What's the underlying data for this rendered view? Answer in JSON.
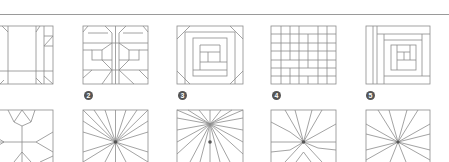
{
  "figure": {
    "line_color": "#8c8c8c",
    "badge_color": "#555555",
    "top_row": [
      {
        "index": 1,
        "badge": "",
        "pattern": "shoofly-variant",
        "badge_visible": false
      },
      {
        "index": 2,
        "badge": "2",
        "pattern": "bow-tie-block"
      },
      {
        "index": 3,
        "badge": "3",
        "pattern": "log-cabin-octagon"
      },
      {
        "index": 4,
        "badge": "4",
        "pattern": "brick-grid"
      },
      {
        "index": 5,
        "badge": "5",
        "pattern": "log-cabin-offset"
      }
    ],
    "bottom_row": [
      {
        "index": 6,
        "pattern": "star-flower"
      },
      {
        "index": 7,
        "pattern": "sunburst-radial"
      },
      {
        "index": 8,
        "pattern": "sunburst-radial-dense"
      },
      {
        "index": 9,
        "pattern": "radial-forked"
      },
      {
        "index": 10,
        "pattern": "radial-sparse"
      }
    ]
  }
}
